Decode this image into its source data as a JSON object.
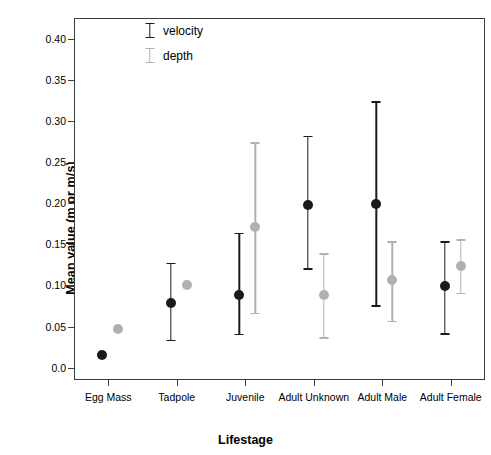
{
  "chart_data": {
    "type": "scatter",
    "title": "",
    "xlabel": "Lifestage",
    "ylabel": "Mean value (m or m/s)",
    "categories": [
      "Egg Mass",
      "Tadpole",
      "Juvenile",
      "Adult Unknown",
      "Adult Male",
      "Adult Female"
    ],
    "ylim": [
      -0.015,
      0.425
    ],
    "yticks": [
      0.0,
      0.05,
      0.1,
      0.15,
      0.2,
      0.25,
      0.3,
      0.35,
      0.4
    ],
    "ytick_labels": [
      "0.0",
      "0.05",
      "0.10",
      "0.15",
      "0.20",
      "0.25",
      "0.30",
      "0.35",
      "0.40"
    ],
    "grid": false,
    "legend_position": "top-left-inside",
    "series": [
      {
        "name": "velocity",
        "color": "#1a1a1a",
        "values": [
          0.017,
          0.08,
          0.09,
          0.199,
          0.2,
          0.1
        ],
        "err_low": [
          null,
          0.035,
          0.042,
          0.122,
          0.077,
          0.043
        ],
        "err_high": [
          null,
          0.129,
          0.165,
          0.283,
          0.325,
          0.155
        ]
      },
      {
        "name": "depth",
        "color": "#b0b0b0",
        "values": [
          0.048,
          0.102,
          0.172,
          0.09,
          0.108,
          0.125
        ],
        "err_low": [
          null,
          null,
          0.068,
          0.038,
          0.058,
          0.092
        ],
        "err_high": [
          null,
          null,
          0.275,
          0.14,
          0.155,
          0.157
        ]
      }
    ]
  },
  "legend": {
    "entries": [
      {
        "label": "velocity"
      },
      {
        "label": "depth"
      }
    ]
  }
}
